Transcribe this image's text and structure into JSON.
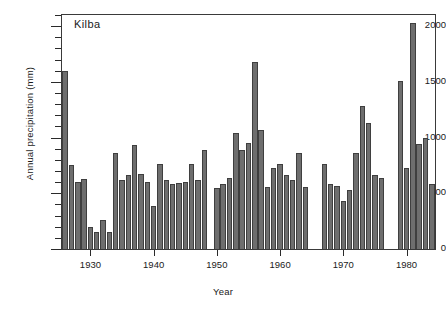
{
  "chart_data": {
    "type": "bar",
    "title": "Kilba",
    "xlabel": "Year",
    "ylabel": "Annual precipitation (mm)",
    "xlim": [
      1925.5,
      1984.5
    ],
    "ylim": [
      0,
      2100
    ],
    "grid": false,
    "legend": null,
    "y_ticks_major": [
      0,
      500,
      1000,
      1500,
      2000
    ],
    "y_tick_labels": [
      "0",
      "500",
      "1000",
      "1500",
      "2000"
    ],
    "y_tick_minor_step": 100,
    "x_ticks": [
      1930,
      1940,
      1950,
      1960,
      1970,
      1980
    ],
    "x_tick_labels": [
      "1930",
      "1940",
      "1950",
      "1960",
      "1970",
      "1980"
    ],
    "bar_color": "#6e6e6e",
    "bar_edge_color": "#3f3f3f",
    "categories": [
      1926,
      1927,
      1928,
      1929,
      1930,
      1931,
      1932,
      1933,
      1934,
      1935,
      1936,
      1937,
      1938,
      1939,
      1940,
      1941,
      1942,
      1943,
      1944,
      1945,
      1946,
      1947,
      1948,
      1950,
      1951,
      1952,
      1953,
      1954,
      1955,
      1956,
      1957,
      1958,
      1959,
      1960,
      1961,
      1962,
      1963,
      1964,
      1967,
      1968,
      1969,
      1970,
      1971,
      1972,
      1973,
      1974,
      1975,
      1976,
      1979,
      1980,
      1981,
      1982,
      1983,
      1984
    ],
    "values": [
      1600,
      750,
      600,
      630,
      200,
      150,
      260,
      155,
      860,
      620,
      660,
      930,
      670,
      600,
      390,
      760,
      620,
      580,
      590,
      600,
      760,
      620,
      890,
      550,
      580,
      640,
      1040,
      890,
      950,
      1680,
      1070,
      560,
      730,
      760,
      660,
      620,
      860,
      560,
      760,
      580,
      570,
      430,
      530,
      860,
      1280,
      1130,
      660,
      640,
      1510,
      730,
      2030,
      940,
      1000,
      580
    ],
    "missing_years": [
      1949,
      1965,
      1966,
      1977,
      1978
    ]
  }
}
